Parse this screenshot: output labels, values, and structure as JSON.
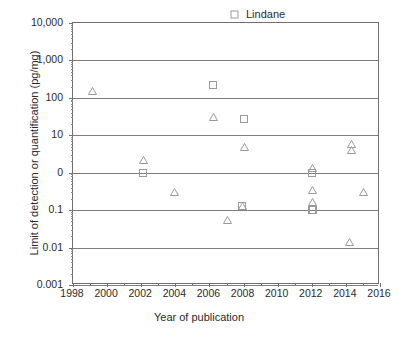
{
  "chart_data": {
    "type": "scatter",
    "title": "",
    "xlabel": "Year of publication",
    "ylabel": "Limit of detection or quantification (pg/mg)",
    "xlim": [
      1998,
      2016
    ],
    "ylim": [
      0.001,
      10000
    ],
    "yscale": "log",
    "xticks": [
      1998,
      2000,
      2002,
      2004,
      2006,
      2008,
      2010,
      2012,
      2014,
      2016
    ],
    "xtick_labels": [
      "1998",
      "2000",
      "2002",
      "2004",
      "2006",
      "2008",
      "2010",
      "2012",
      "2014",
      "2016"
    ],
    "yticks": [
      10000,
      1000,
      100,
      10,
      1,
      0.1,
      0.01,
      0.001
    ],
    "ytick_labels": [
      "10,000",
      "1,000",
      "100",
      "10",
      "0",
      "0.1",
      "0.01",
      "0.001"
    ],
    "grid": "horizontal",
    "legend_position": "top-right",
    "series": [
      {
        "name": "Lindane",
        "marker": "open-square",
        "color": "#9a9a9a",
        "points": [
          {
            "x": 2006.2,
            "y": 220
          },
          {
            "x": 2008.0,
            "y": 28
          },
          {
            "x": 2002.1,
            "y": 1.0
          },
          {
            "x": 2007.9,
            "y": 0.13
          },
          {
            "x": 2012.0,
            "y": 1.0
          },
          {
            "x": 2012.0,
            "y": 0.1
          },
          {
            "x": 2012.1,
            "y": 0.1
          }
        ]
      },
      {
        "name": "p,p'-DDT",
        "marker": "open-triangle",
        "color": "#9a9a9a",
        "points": [
          {
            "x": 1999.1,
            "y": 150
          },
          {
            "x": 2006.2,
            "y": 30
          },
          {
            "x": 2008.0,
            "y": 5.0
          },
          {
            "x": 2002.1,
            "y": 2.2
          },
          {
            "x": 2003.9,
            "y": 0.3
          },
          {
            "x": 2007.0,
            "y": 0.055
          },
          {
            "x": 2007.9,
            "y": 0.13
          },
          {
            "x": 2012.0,
            "y": 1.3
          },
          {
            "x": 2012.0,
            "y": 0.35
          },
          {
            "x": 2012.0,
            "y": 0.17
          },
          {
            "x": 2014.3,
            "y": 6.0
          },
          {
            "x": 2014.3,
            "y": 4.0
          },
          {
            "x": 2015.0,
            "y": 0.3
          },
          {
            "x": 2014.2,
            "y": 0.014
          }
        ]
      }
    ]
  },
  "legend": {
    "items": [
      {
        "label": "Lindane",
        "marker": "open-square",
        "italic_prefix": ""
      },
      {
        "label": "-DDT",
        "marker": "open-triangle",
        "italic_prefix": "p,p′"
      }
    ]
  },
  "axes": {
    "x_title": "Year of publication",
    "y_title": "Limit of detection or quantification (pg/mg)"
  }
}
